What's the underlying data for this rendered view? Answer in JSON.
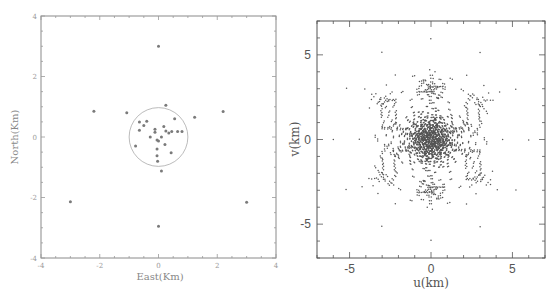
{
  "chart_data": [
    {
      "type": "scatter",
      "title": "",
      "xlabel": "East(Km)",
      "ylabel": "North(Km)",
      "xlim": [
        -4,
        4
      ],
      "ylim": [
        -4,
        4
      ],
      "xticks": [
        -4,
        -2,
        0,
        2,
        4
      ],
      "yticks": [
        -4,
        -2,
        0,
        2,
        4
      ],
      "grid": false,
      "annotations": [
        {
          "shape": "circle",
          "center": [
            0,
            0
          ],
          "radius_km": 1.0
        }
      ],
      "points": [
        [
          0.0,
          3.0
        ],
        [
          -2.2,
          0.85
        ],
        [
          -1.08,
          0.8
        ],
        [
          2.2,
          0.84
        ],
        [
          1.23,
          0.65
        ],
        [
          0.25,
          1.05
        ],
        [
          -3.0,
          -2.14
        ],
        [
          3.0,
          -2.16
        ],
        [
          0.0,
          -2.95
        ],
        [
          0.1,
          -1.12
        ],
        [
          -0.65,
          0.5
        ],
        [
          -0.5,
          0.38
        ],
        [
          -0.4,
          0.52
        ],
        [
          -0.65,
          0.22
        ],
        [
          -0.12,
          0.26
        ],
        [
          -0.12,
          0.16
        ],
        [
          0.18,
          0.35
        ],
        [
          0.55,
          0.6
        ],
        [
          0.25,
          0.2
        ],
        [
          0.35,
          0.13
        ],
        [
          0.45,
          0.18
        ],
        [
          0.65,
          0.18
        ],
        [
          0.8,
          0.18
        ],
        [
          -0.28,
          0.0
        ],
        [
          -0.05,
          -0.1
        ],
        [
          0.0,
          -0.13
        ],
        [
          0.1,
          0.0
        ],
        [
          -0.78,
          -0.3
        ],
        [
          -0.05,
          -0.4
        ],
        [
          0.22,
          -0.25
        ],
        [
          0.43,
          -0.52
        ],
        [
          -0.05,
          -0.62
        ],
        [
          -0.03,
          -0.8
        ]
      ],
      "color": "#7a7a7a"
    },
    {
      "type": "scatter",
      "title": "",
      "xlabel": "u(km)",
      "ylabel": "v(km)",
      "xlim": [
        -7,
        7
      ],
      "ylim": [
        -7,
        7
      ],
      "xticks": [
        -5,
        0,
        5
      ],
      "yticks": [
        -5,
        0,
        5
      ],
      "grid": false,
      "description": "uv coverage derived from baselines of the left-panel antenna array (dense core near origin, arcs and outer isolated points out to ~6 km)",
      "color": "#555555"
    }
  ],
  "left_panel": {
    "xlabel": "East(Km)",
    "ylabel": "North(Km)",
    "xtick_labels": [
      "-4",
      "-2",
      "0",
      "2",
      "4"
    ],
    "ytick_labels": [
      "4",
      "2",
      "0",
      "-2",
      "-4"
    ]
  },
  "right_panel": {
    "xlabel": "u(km)",
    "ylabel": "v(km)",
    "xtick_labels": [
      "-5",
      "0",
      "5"
    ],
    "ytick_labels": [
      "5",
      "0",
      "-5"
    ]
  }
}
